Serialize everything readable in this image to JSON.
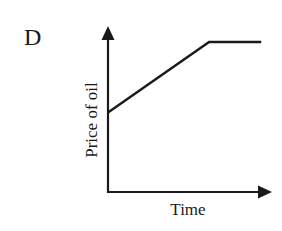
{
  "panel": {
    "label": "D"
  },
  "chart_data": {
    "type": "line",
    "title": "",
    "xlabel": "Time",
    "ylabel": "Price of oil",
    "grid": false,
    "legend": null,
    "axis_ticks": "none",
    "series": [
      {
        "name": "Price of oil",
        "points_normalized": [
          {
            "x": 0.0,
            "y": 0.53
          },
          {
            "x": 0.62,
            "y": 1.0
          },
          {
            "x": 0.94,
            "y": 1.0
          }
        ],
        "description": "Starts at a positive price, rises linearly, then levels off (constant)"
      }
    ],
    "xlim": [
      0,
      1
    ],
    "ylim": [
      0,
      1.1
    ]
  },
  "colors": {
    "ink": "#1a1a1a",
    "background": "#ffffff"
  }
}
